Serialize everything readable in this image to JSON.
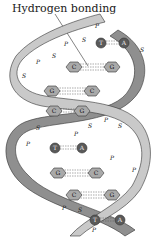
{
  "label": "Hydrogen bonding",
  "colors": {
    "strand_front": "#c9c9c9",
    "strand_back": "#8f8f8f",
    "base_light": "#a9a9a9",
    "base_dark": "#5a5a5a",
    "outline": "#333333"
  },
  "strand_symbols": {
    "sugar": "S",
    "phosphate": "P"
  },
  "base_pairs": [
    {
      "left": "T",
      "right": "A"
    },
    {
      "left": "C",
      "right": "G"
    },
    {
      "left": "G",
      "right": "C"
    },
    {
      "left": "C",
      "right": "G"
    },
    {
      "left": "T",
      "right": "A"
    },
    {
      "left": "G",
      "right": "C"
    },
    {
      "left": "C",
      "right": "G"
    },
    {
      "left": "T",
      "right": "A"
    }
  ]
}
